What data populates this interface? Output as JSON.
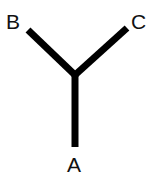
{
  "canvas": {
    "width": 151,
    "height": 185,
    "background_color": "#ffffff"
  },
  "diagram": {
    "type": "y-junction",
    "title": "",
    "stroke_color": "#000000",
    "stroke_width": 7,
    "junction": {
      "x": 75,
      "y": 75
    },
    "branches": [
      {
        "id": "branch-a",
        "label": "A",
        "from": {
          "x": 75,
          "y": 75
        },
        "to": {
          "x": 75,
          "y": 147
        },
        "direction": "down"
      },
      {
        "id": "branch-b",
        "label": "B",
        "from": {
          "x": 75,
          "y": 75
        },
        "to": {
          "x": 28,
          "y": 30
        },
        "direction": "upper-left"
      },
      {
        "id": "branch-c",
        "label": "C",
        "from": {
          "x": 75,
          "y": 75
        },
        "to": {
          "x": 127,
          "y": 28
        },
        "direction": "upper-right"
      }
    ],
    "labels": {
      "a": "A",
      "b": "B",
      "c": "C"
    },
    "label_color": "#111111"
  }
}
